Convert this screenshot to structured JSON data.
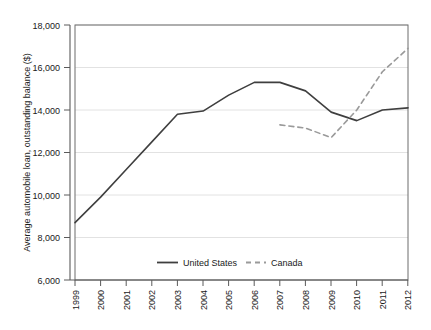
{
  "chart_data": {
    "type": "line",
    "title": "",
    "xlabel": "",
    "ylabel": "Average automobile loan, outstanding balance ($)",
    "x": [
      1999,
      2000,
      2001,
      2002,
      2003,
      2004,
      2005,
      2006,
      2007,
      2008,
      2009,
      2010,
      2011,
      2012
    ],
    "xtick_labels": [
      "1999",
      "2000",
      "2001",
      "2002",
      "2003",
      "2004",
      "2005",
      "2006",
      "2007",
      "2008",
      "2009",
      "2010",
      "2011",
      "2012"
    ],
    "ytick_labels": [
      "6,000",
      "8,000",
      "10,000",
      "12,000",
      "14,000",
      "16,000",
      "18,000"
    ],
    "yticks": [
      6000,
      8000,
      10000,
      12000,
      14000,
      16000,
      18000
    ],
    "ylim": [
      6000,
      18000
    ],
    "xlim": [
      1999,
      2012
    ],
    "grid": true,
    "legend_position": "bottom-center",
    "series": [
      {
        "name": "United States",
        "style": "solid",
        "color": "#3f3f3f",
        "x": [
          1999,
          2000,
          2001,
          2002,
          2003,
          2004,
          2005,
          2006,
          2007,
          2008,
          2009,
          2010,
          2011,
          2012
        ],
        "values": [
          8700,
          9900,
          11200,
          12500,
          13800,
          13950,
          14700,
          15300,
          15300,
          14900,
          13900,
          13500,
          14000,
          14100
        ]
      },
      {
        "name": "Canada",
        "style": "dashed",
        "color": "#9a9a9a",
        "x": [
          2007,
          2008,
          2009,
          2010,
          2011,
          2012
        ],
        "values": [
          13300,
          13150,
          12700,
          14000,
          15800,
          16900
        ]
      }
    ]
  },
  "legend": {
    "items": [
      {
        "label": "United States",
        "style": "solid"
      },
      {
        "label": "Canada",
        "style": "dashed"
      }
    ]
  }
}
